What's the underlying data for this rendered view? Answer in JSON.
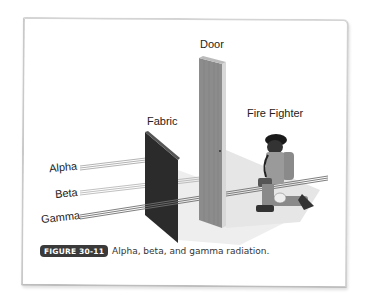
{
  "figure": {
    "labels": {
      "door": "Door",
      "fabric": "Fabric",
      "fire_fighter": "Fire Fighter",
      "alpha": "Alpha",
      "beta": "Beta",
      "gamma": "Gamma"
    },
    "caption": {
      "badge": "FIGURE 30-11",
      "text": "Alpha, beta, and gamma radiation."
    },
    "colors": {
      "fabric": "#2b2b2b",
      "door": "#8a8a8a",
      "badge_bg": "#3a3a3a",
      "beam": "#9a9a9a"
    }
  }
}
